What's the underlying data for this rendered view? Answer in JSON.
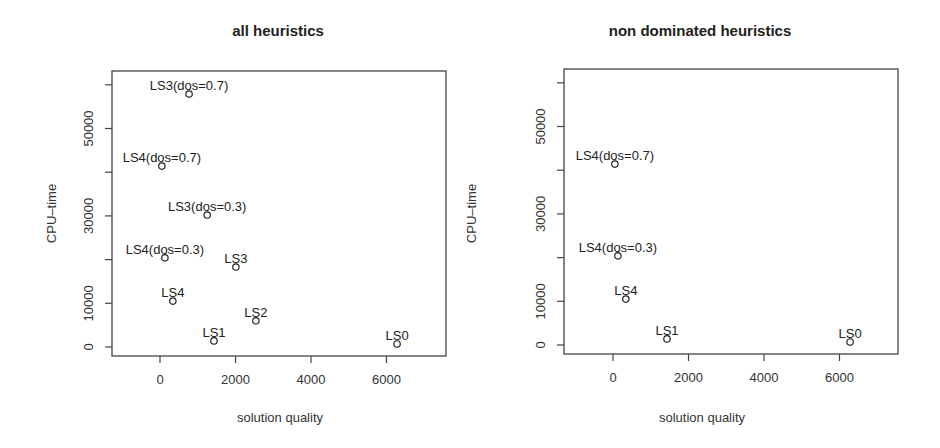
{
  "chart_data": [
    {
      "type": "scatter",
      "title": "all heuristics",
      "xlabel": "solution quality",
      "ylabel": "CPU–time",
      "xlim": [
        -1300,
        7600
      ],
      "ylim": [
        -2000,
        63000
      ],
      "x_ticks": [
        0,
        2000,
        4000,
        6000
      ],
      "x_tick_labels": [
        "0",
        "2000",
        "4000",
        "6000"
      ],
      "y_ticks": [
        0,
        10000,
        20000,
        30000,
        40000,
        50000,
        60000
      ],
      "y_tick_labels": [
        "0",
        "10000",
        "",
        "30000",
        "",
        "50000",
        ""
      ],
      "grid": false,
      "legend": null,
      "points": [
        {
          "label": "LS3(dos=0.7)",
          "x": 770,
          "y": 57900
        },
        {
          "label": "LS4(dos=0.7)",
          "x": 50,
          "y": 41400
        },
        {
          "label": "LS3(dos=0.3)",
          "x": 1250,
          "y": 30200
        },
        {
          "label": "LS4(dos=0.3)",
          "x": 130,
          "y": 20400
        },
        {
          "label": "LS3",
          "x": 2010,
          "y": 18300
        },
        {
          "label": "LS4",
          "x": 340,
          "y": 10500
        },
        {
          "label": "LS2",
          "x": 2540,
          "y": 6000
        },
        {
          "label": "LS1",
          "x": 1430,
          "y": 1400
        },
        {
          "label": "LS0",
          "x": 6280,
          "y": 700
        }
      ]
    },
    {
      "type": "scatter",
      "title": "non dominated heuristics",
      "xlabel": "solution quality",
      "ylabel": "CPU–time",
      "xlim": [
        -1300,
        7600
      ],
      "ylim": [
        -2000,
        63000
      ],
      "x_ticks": [
        0,
        2000,
        4000,
        6000
      ],
      "x_tick_labels": [
        "0",
        "2000",
        "4000",
        "6000"
      ],
      "y_ticks": [
        0,
        10000,
        20000,
        30000,
        40000,
        50000,
        60000
      ],
      "y_tick_labels": [
        "0",
        "10000",
        "",
        "30000",
        "",
        "50000",
        ""
      ],
      "grid": false,
      "legend": null,
      "points": [
        {
          "label": "LS4(dos=0.7)",
          "x": 50,
          "y": 41400
        },
        {
          "label": "LS4(dos=0.3)",
          "x": 130,
          "y": 20400
        },
        {
          "label": "LS4",
          "x": 340,
          "y": 10500
        },
        {
          "label": "LS1",
          "x": 1430,
          "y": 1400
        },
        {
          "label": "LS0",
          "x": 6280,
          "y": 700
        }
      ]
    }
  ],
  "layout": [
    {
      "box": {
        "left": 112,
        "top": 71,
        "right": 446,
        "bottom": 356
      },
      "x0_px": 160,
      "x_px_per_unit": 0.03775,
      "y0_px": 347,
      "y_px_per_unit": 0.00437
    },
    {
      "box": {
        "left": 564,
        "top": 69,
        "right": 898,
        "bottom": 354
      },
      "x0_px": 613,
      "x_px_per_unit": 0.03775,
      "y0_px": 345,
      "y_px_per_unit": 0.00437
    }
  ],
  "colors": {
    "axis": "#444444",
    "text": "#2a2a2a",
    "marker": "#222222",
    "background": "#ffffff"
  }
}
